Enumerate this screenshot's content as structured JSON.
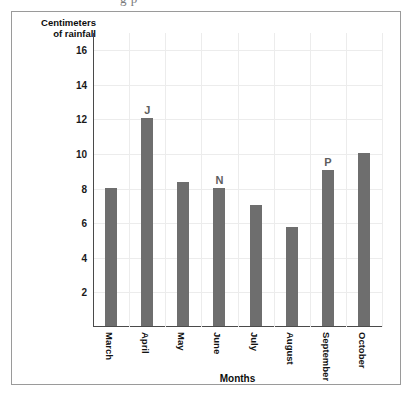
{
  "clipped_caption": "g p",
  "chart_data": {
    "type": "bar",
    "title": "",
    "xlabel": "Months",
    "ylabel": "Centimeters of rainfall",
    "ylabel_lines": [
      "Centimeters",
      "of rainfall"
    ],
    "categories": [
      "March",
      "April",
      "May",
      "June",
      "July",
      "August",
      "September",
      "October"
    ],
    "values": [
      8,
      12,
      8.3,
      8,
      7,
      5.7,
      9,
      10
    ],
    "point_labels": [
      "",
      "J",
      "",
      "N",
      "",
      "",
      "P",
      ""
    ],
    "series": [
      {
        "name": "Rainfall",
        "values": [
          8,
          12,
          8.3,
          8,
          7,
          5.7,
          9,
          10
        ]
      }
    ],
    "yticks": [
      2,
      4,
      6,
      8,
      10,
      12,
      14,
      16
    ],
    "ylim": [
      0,
      17
    ],
    "grid": true,
    "legend": "none",
    "bar_color": "#6e6e6e",
    "grid_color": "#ececec",
    "axis_color": "#4a4a4a",
    "frame_color": "#9a9a9a"
  }
}
